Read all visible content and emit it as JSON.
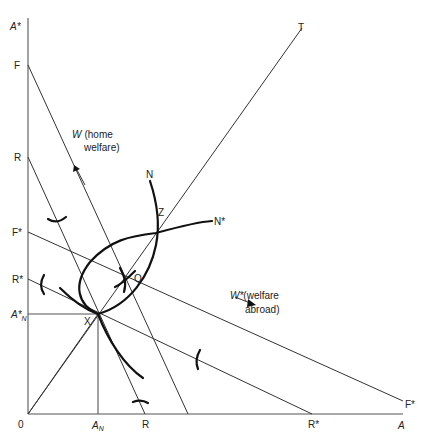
{
  "diagram": {
    "axes": {
      "vertical_label": "A*",
      "horizontal_label": "A",
      "origin_label": "0"
    },
    "vertical_ticks": [
      "F",
      "R",
      "F*",
      "R*",
      "A*N"
    ],
    "vertical_tick_labels": {
      "F": "F",
      "R": "R",
      "F_star": "F*",
      "R_star": "R*",
      "AN_star_main": "A*",
      "AN_star_sub": "N"
    },
    "horizontal_tick_labels": {
      "AN_main": "A",
      "AN_sub": "N",
      "R": "R",
      "R_star": "R*",
      "A": "A",
      "F_star": "F*"
    },
    "points": {
      "X": "X",
      "Q": "Q",
      "Z": "Z",
      "T": "T"
    },
    "curves": {
      "N": "N",
      "N_star": "N*"
    },
    "welfare_home": {
      "symbol": "W",
      "line1": "(home",
      "line2": "welfare)"
    },
    "welfare_abroad": {
      "symbol": "W*",
      "line1": "(welfare",
      "line2": "abroad)"
    },
    "colors": {
      "ink": "#111111",
      "thin_line": "#333333",
      "background": "#ffffff"
    }
  }
}
